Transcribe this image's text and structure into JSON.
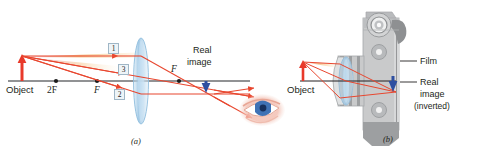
{
  "figure": {
    "panel_a": {
      "caption": "(a)",
      "labels": {
        "object": "Object",
        "two_f": "2F",
        "focal_left": "F",
        "focal_right": "F",
        "real_image_line1": "Real",
        "real_image_line2": "image"
      },
      "ray_numbers": [
        "1",
        "3",
        "2"
      ],
      "icons": {
        "object_arrow": "up-arrow-icon",
        "lens": "converging-lens-icon",
        "image_arrow": "down-arrow-icon",
        "eye": "eye-icon",
        "axis": "optical-axis-line"
      }
    },
    "panel_b": {
      "caption": "(b)",
      "labels": {
        "object": "Object",
        "film": "Film",
        "real_image_line1": "Real",
        "real_image_line2": "image",
        "real_image_line3": "(inverted)"
      },
      "icons": {
        "camera_body": "camera-icon",
        "camera_lens": "camera-lens-icon",
        "object_arrow": "up-arrow-icon",
        "image_arrow": "down-arrow-icon",
        "shutter_button": "shutter-button-icon",
        "viewfinder": "viewfinder-icon"
      }
    }
  },
  "colors": {
    "ray": "#e8472f",
    "object_arrow": "#e8392a",
    "image_arrow": "#2f4fa0",
    "axis": "#6d6e71",
    "lens_blue": "#aacbe6",
    "camera_gray": "#c9cacb",
    "label_text": "#231f20",
    "ray_label_box": "#eef4f7"
  }
}
